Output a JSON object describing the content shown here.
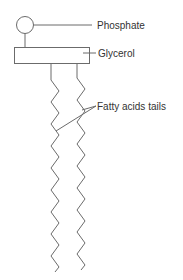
{
  "diagram": {
    "labels": {
      "phosphate": "Phosphate",
      "glycerol": "Glycerol",
      "tails": "Fatty acids tails"
    },
    "colors": {
      "stroke": "#6b6b6b",
      "text": "#333333",
      "background": "#ffffff"
    },
    "parts": [
      "phosphate-head",
      "glycerol-block",
      "fatty-acid-tail-left",
      "fatty-acid-tail-right"
    ]
  }
}
